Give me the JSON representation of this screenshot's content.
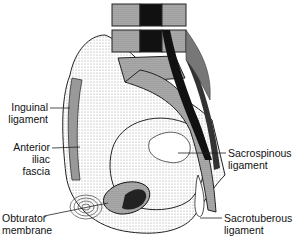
{
  "figure": {
    "labels": {
      "inguinal": [
        "Inguinal",
        "ligament"
      ],
      "anterior_iliac_fascia": [
        "Anterior",
        "iliac",
        "fascia"
      ],
      "obturator": [
        "Obturator",
        "membrane"
      ],
      "sacrospinous": [
        "Sacrospinous",
        "ligament"
      ],
      "sacrotuberous": [
        "Sacrotuberous",
        "ligament"
      ]
    }
  }
}
